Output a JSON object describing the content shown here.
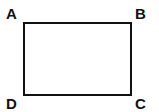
{
  "diagram": {
    "shape": "rectangle",
    "vertices": {
      "top_left": "A",
      "top_right": "B",
      "bottom_right": "C",
      "bottom_left": "D"
    }
  }
}
